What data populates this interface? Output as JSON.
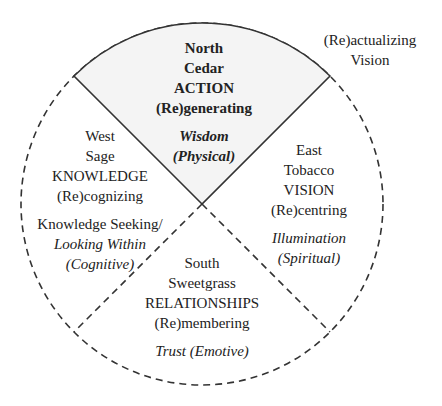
{
  "diagram": {
    "center": {
      "x": 202,
      "y": 204
    },
    "radius": 181,
    "colors": {
      "north_fill": "#f4f4f4",
      "stroke": "#333333",
      "text": "#222222"
    },
    "outside_label": {
      "line1": "(Re)actualizing",
      "line2": "Vision"
    },
    "north": {
      "direction": "North",
      "medicine": "Cedar",
      "domain": "ACTION",
      "process": "(Re)generating",
      "quality": "Wisdom",
      "aspect": "(Physical)"
    },
    "east": {
      "direction": "East",
      "medicine": "Tobacco",
      "domain": "VISION",
      "process": "(Re)centring",
      "quality": "Illumination",
      "aspect": "(Spiritual)"
    },
    "south": {
      "direction": "South",
      "medicine": "Sweetgrass",
      "domain": "RELATIONSHIPS",
      "process": "(Re)membering",
      "quality": "Trust (Emotive)"
    },
    "west": {
      "direction": "West",
      "medicine": "Sage",
      "domain": "KNOWLEDGE",
      "process": "(Re)cognizing",
      "quality_line1": "Knowledge Seeking/",
      "quality_line2": "Looking Within",
      "aspect": "(Cognitive)"
    }
  }
}
